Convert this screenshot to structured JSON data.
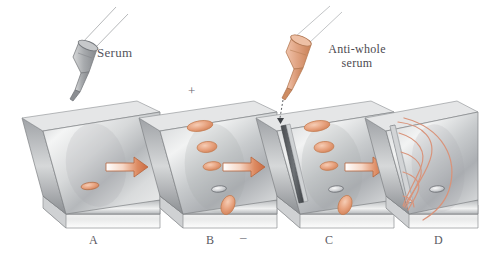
{
  "figure": {
    "type": "diagram",
    "background_color": "#ffffff",
    "panel_count": 4
  },
  "labels": {
    "serum": "Serum",
    "anti_whole_serum": "Anti-whole serum",
    "plus_sign": "+",
    "minus_sign": "–"
  },
  "panels": [
    {
      "id": "A",
      "letter": "A",
      "description": "glass slide with agar gel and single sample well",
      "spot_count": 1
    },
    {
      "id": "B",
      "letter": "B",
      "description": "slide after electrophoresis, separated protein bands",
      "spot_count": 5
    },
    {
      "id": "C",
      "letter": "C",
      "description": "slide with antiserum trough cut and filled",
      "spot_count": 5
    },
    {
      "id": "D",
      "letter": "D",
      "description": "slide showing precipitin arcs after diffusion",
      "spot_count": 1
    }
  ],
  "droppers": [
    {
      "name": "serum-dropper",
      "label": "Serum",
      "color": "#8c8c92",
      "target_panel": "A"
    },
    {
      "name": "antiserum-dropper",
      "label": "Anti-whole serum",
      "color": "#d89a7c",
      "target_panel": "C"
    }
  ],
  "arrows": [
    {
      "from": "A",
      "to": "B"
    },
    {
      "from": "B",
      "to": "C"
    },
    {
      "from": "C",
      "to": "D"
    }
  ],
  "colors": {
    "slide_gray_light": "#f2f2f2",
    "slide_gray_mid": "#b9bbbd",
    "slide_gray_dark": "#7f8286",
    "spot_orange": "#e8a583",
    "spot_orange_dark": "#c9744b",
    "spot_gray": "#8f9297",
    "arrow_orange": "#d2714a",
    "arc_salmon": "#d9937a",
    "text_gray": "#55555d"
  },
  "spots": {
    "panel_a": [
      {
        "x": 0.52,
        "y": 0.62,
        "color": "#d08459",
        "type": "well"
      }
    ],
    "panel_b": [
      {
        "index": 1,
        "color": "#e8a583",
        "type": "band"
      },
      {
        "index": 2,
        "color": "#e09a74",
        "type": "band"
      },
      {
        "index": 3,
        "color": "#e8a98a",
        "type": "band"
      },
      {
        "index": 4,
        "color": "#8f9297",
        "type": "well"
      },
      {
        "index": 5,
        "color": "#e6a17f",
        "type": "band"
      }
    ],
    "panel_c": [
      {
        "index": 1,
        "color": "#e8a583",
        "type": "band"
      },
      {
        "index": 2,
        "color": "#e09a74",
        "type": "band"
      },
      {
        "index": 3,
        "color": "#e8a98a",
        "type": "band"
      },
      {
        "index": 4,
        "color": "#8f9297",
        "type": "well"
      },
      {
        "index": 5,
        "color": "#e6a17f",
        "type": "band"
      }
    ],
    "panel_d": [
      {
        "index": 1,
        "color": "#9a9da1",
        "type": "well"
      }
    ]
  }
}
